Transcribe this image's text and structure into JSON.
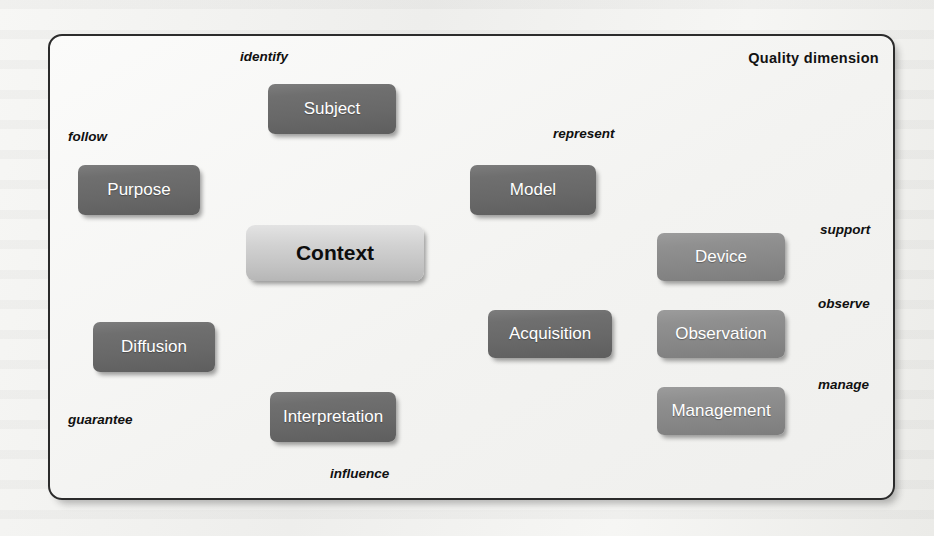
{
  "frame": {
    "title": "Quality dimension"
  },
  "colors": {
    "node_dark": "#6a6a6a",
    "node_mid": "#8b8b8b",
    "node_center": "#cdcdcd",
    "frame_border": "#2b2b2b",
    "connector": "#121212",
    "flow_arrow": "#8a8a8a",
    "node_text": "#ffffff",
    "center_text": "#0d0d0d",
    "label_text": "#101010"
  },
  "nodes": [
    {
      "id": "context",
      "label": "Context",
      "style": "center",
      "x": 246,
      "y": 225,
      "w": 178,
      "h": 56
    },
    {
      "id": "subject",
      "label": "Subject",
      "style": "dark",
      "x": 268,
      "y": 84,
      "w": 128,
      "h": 50
    },
    {
      "id": "purpose",
      "label": "Purpose",
      "style": "dark",
      "x": 78,
      "y": 165,
      "w": 122,
      "h": 50
    },
    {
      "id": "model",
      "label": "Model",
      "style": "dark",
      "x": 470,
      "y": 165,
      "w": 126,
      "h": 50
    },
    {
      "id": "diffusion",
      "label": "Diffusion",
      "style": "dark",
      "x": 93,
      "y": 322,
      "w": 122,
      "h": 50
    },
    {
      "id": "interpretation",
      "label": "Interpretation",
      "style": "dark",
      "x": 270,
      "y": 392,
      "w": 126,
      "h": 50
    },
    {
      "id": "acquisition",
      "label": "Acquisition",
      "style": "dark",
      "x": 488,
      "y": 310,
      "w": 124,
      "h": 48
    },
    {
      "id": "device",
      "label": "Device",
      "style": "mid",
      "x": 657,
      "y": 233,
      "w": 128,
      "h": 48
    },
    {
      "id": "observation",
      "label": "Observation",
      "style": "mid",
      "x": 657,
      "y": 310,
      "w": 128,
      "h": 48
    },
    {
      "id": "management",
      "label": "Management",
      "style": "mid",
      "x": 657,
      "y": 387,
      "w": 128,
      "h": 48
    }
  ],
  "role_labels": [
    {
      "id": "identify",
      "text": "identify",
      "x": 240,
      "y": 49,
      "align": "left"
    },
    {
      "id": "follow",
      "text": "follow",
      "x": 68,
      "y": 129,
      "align": "left"
    },
    {
      "id": "represent",
      "text": "represent",
      "x": 553,
      "y": 126,
      "align": "left"
    },
    {
      "id": "support",
      "text": "support",
      "x": 820,
      "y": 222,
      "align": "left"
    },
    {
      "id": "observe",
      "text": "observe",
      "x": 818,
      "y": 296,
      "align": "left"
    },
    {
      "id": "manage",
      "text": "manage",
      "x": 818,
      "y": 377,
      "align": "left"
    },
    {
      "id": "guarantee",
      "text": "guarantee",
      "x": 68,
      "y": 412,
      "align": "left"
    },
    {
      "id": "influence",
      "text": "influence",
      "x": 330,
      "y": 466,
      "align": "left"
    }
  ],
  "connectors": [
    {
      "id": "context-subject",
      "from": "context",
      "to": "subject",
      "from_dot": [
        332,
        222
      ],
      "to_dot": [
        332,
        137
      ]
    },
    {
      "id": "context-purpose",
      "from": "context",
      "to": "purpose",
      "from_dot": [
        249,
        245
      ],
      "to_dot": [
        200,
        192
      ]
    },
    {
      "id": "context-model",
      "from": "context",
      "to": "model",
      "from_dot": [
        424,
        245
      ],
      "to_dot": [
        470,
        194
      ]
    },
    {
      "id": "context-diffusion",
      "from": "context",
      "to": "diffusion",
      "from_dot": [
        249,
        268
      ],
      "to_dot": [
        153,
        322
      ]
    },
    {
      "id": "context-interpretation",
      "from": "context",
      "to": "interpretation",
      "from_dot": [
        332,
        283
      ],
      "to_dot": [
        332,
        390
      ]
    },
    {
      "id": "context-acquisition",
      "from": "context",
      "to": "acquisition",
      "from_dot": [
        424,
        268
      ],
      "to_dot": [
        488,
        314
      ]
    },
    {
      "id": "acquisition-device",
      "from": "acquisition",
      "to": "device",
      "from_dot": [
        610,
        311
      ],
      "to_dot": [
        657,
        263
      ]
    },
    {
      "id": "acquisition-observation",
      "from": "acquisition",
      "to": "observation",
      "from_dot": [
        610,
        334
      ],
      "to_dot": [
        657,
        334
      ]
    },
    {
      "id": "acquisition-management",
      "from": "acquisition",
      "to": "management",
      "from_dot": [
        610,
        357
      ],
      "to_dot": [
        657,
        403
      ]
    },
    {
      "id": "subject-identify",
      "from": "subject",
      "to": "identify",
      "from_dot": [
        330,
        82
      ],
      "to_dot": [
        306,
        62
      ]
    },
    {
      "id": "purpose-follow",
      "from": "purpose",
      "to": "follow",
      "from_dot": [
        122,
        158
      ],
      "to_dot": [
        99,
        138
      ]
    },
    {
      "id": "model-represent",
      "from": "model",
      "to": "represent",
      "from_dot": [
        534,
        163
      ],
      "to_dot": [
        562,
        144
      ]
    },
    {
      "id": "device-support",
      "from": "device",
      "to": "support",
      "from_dot": [
        784,
        258
      ],
      "to_dot": [
        810,
        239
      ]
    },
    {
      "id": "observation-observe",
      "from": "observation",
      "to": "observe",
      "from_dot": [
        784,
        335
      ],
      "to_dot": [
        810,
        316
      ]
    },
    {
      "id": "management-manage",
      "from": "management",
      "to": "manage",
      "from_dot": [
        784,
        411
      ],
      "to_dot": [
        810,
        393
      ]
    },
    {
      "id": "diffusion-guarantee",
      "from": "diffusion",
      "to": "guarantee",
      "from_dot": [
        150,
        375
      ],
      "to_dot": [
        124,
        399
      ]
    },
    {
      "id": "interpretation-influence",
      "from": "interpretation",
      "to": "influence",
      "from_dot": [
        333,
        441
      ],
      "to_dot": [
        357,
        463
      ]
    }
  ],
  "flow_arrows": [
    {
      "id": "purpose-to-subject",
      "from": "purpose",
      "to": "subject"
    },
    {
      "id": "subject-to-model",
      "from": "subject",
      "to": "model"
    },
    {
      "id": "model-to-acquisition",
      "from": "model",
      "to": "acquisition"
    },
    {
      "id": "acquisition-to-interpretation",
      "from": "acquisition",
      "to": "interpretation"
    },
    {
      "id": "interpretation-to-diffusion",
      "from": "interpretation",
      "to": "diffusion"
    },
    {
      "id": "diffusion-to-purpose",
      "from": "diffusion",
      "to": "purpose"
    }
  ]
}
